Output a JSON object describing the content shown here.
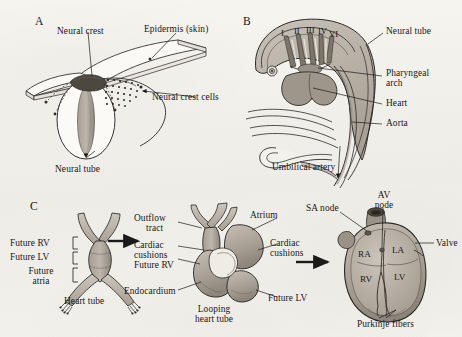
{
  "figure": {
    "background_color": "#f2f1ec",
    "ink_color": "#1a1a1a",
    "tissue_fill": "#b9b2a8",
    "tissue_fill_dark": "#8f877c",
    "tissue_fill_light": "#d4cec5"
  },
  "panels": {
    "a": {
      "letter": "A",
      "labels": {
        "neural_crest": "Neural crest",
        "epidermis": "Epidermis (skin)",
        "neural_crest_cells": "Neural crest cells",
        "neural_tube": "Neural tube"
      }
    },
    "b": {
      "letter": "B",
      "labels": {
        "neural_tube": "Neural tube",
        "pharyngeal_arch_line1": "Pharyngeal",
        "pharyngeal_arch_line2": "arch",
        "heart": "Heart",
        "aorta": "Aorta",
        "umbilical_artery": "Umbilical artery"
      },
      "arch_numerals": [
        "I",
        "II",
        "III",
        "IV",
        "VI"
      ]
    },
    "c": {
      "letter": "C",
      "stage1": {
        "bracket_labels": [
          "Future RV",
          "Future LV",
          "Future\natria"
        ],
        "caption": "Heart tube"
      },
      "stage2": {
        "outflow_tract_line1": "Outflow",
        "outflow_tract_line2": "tract",
        "cardiac_cushions_left_line1": "Cardiac",
        "cardiac_cushions_left_line2": "cushions",
        "future_rv": "Future RV",
        "endocardium": "Endocardium",
        "atrium": "Atrium",
        "cardiac_cushions_right_line1": "Cardiac",
        "cardiac_cushions_right_line2": "cushions",
        "future_lv": "Future LV",
        "caption_line1": "Looping",
        "caption_line2": "heart tube"
      },
      "stage3": {
        "sa_node": "SA node",
        "av_node_line1": "AV",
        "av_node_line2": "node",
        "valve": "Valve",
        "purkinje_fibers": "Purkinje fibers",
        "chambers": {
          "ra": "RA",
          "la": "LA",
          "rv": "RV",
          "lv": "LV"
        }
      }
    }
  }
}
